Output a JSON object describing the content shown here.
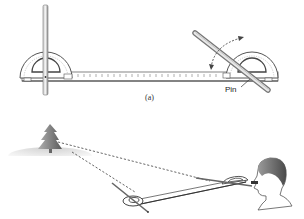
{
  "figure": {
    "part_a": {
      "caption": "(a)",
      "pin_label": "Pin",
      "components": [
        "ruler",
        "protractor-left",
        "protractor-right",
        "vertical-sight-rod",
        "angled-sight-rod",
        "rotation-arrow"
      ]
    },
    "part_b": {
      "components": [
        "tree",
        "hill",
        "sight-line-upper",
        "sight-line-lower",
        "apparatus",
        "observer"
      ]
    },
    "colors": {
      "stroke": "#555555",
      "rod": "#999999",
      "tree": "#7a7a7a",
      "hill": "#dddddd"
    }
  }
}
